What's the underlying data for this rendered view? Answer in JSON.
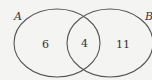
{
  "diagram": {
    "type": "venn",
    "sets": [
      {
        "label": "A",
        "only_count": "6"
      },
      {
        "label": "B",
        "only_count": "11"
      }
    ],
    "intersection_count": "4",
    "stroke_color": "#555555",
    "background": "#f4f4f2"
  }
}
